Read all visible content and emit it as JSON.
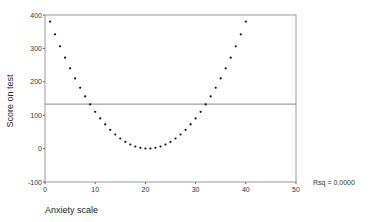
{
  "chart_data": {
    "type": "scatter",
    "title": "",
    "xlabel": "Anxiety scale",
    "ylabel": "Score on test",
    "xlim": [
      0,
      50
    ],
    "ylim": [
      -100,
      400
    ],
    "xticks": [
      0,
      10,
      20,
      30,
      40,
      50
    ],
    "yticks": [
      -100,
      0,
      100,
      200,
      300,
      400
    ],
    "grid": false,
    "legend": null,
    "series": [
      {
        "name": "observations",
        "marker": "dot",
        "color": "#111111",
        "x": [
          1,
          2,
          3,
          4,
          5,
          6,
          7,
          8,
          9,
          10,
          11,
          12,
          13,
          14,
          15,
          16,
          17,
          18,
          19,
          20,
          21,
          22,
          23,
          24,
          25,
          26,
          27,
          28,
          29,
          30,
          31,
          32,
          33,
          34,
          35,
          36,
          37,
          38,
          39,
          40
        ],
        "y": [
          380.25,
          342.25,
          306.25,
          272.25,
          240.25,
          210.25,
          182.25,
          156.25,
          132.25,
          110.25,
          90.25,
          72.25,
          56.25,
          42.25,
          30.25,
          20.25,
          12.25,
          6.25,
          2.25,
          0.25,
          0.25,
          2.25,
          6.25,
          12.25,
          20.25,
          30.25,
          42.25,
          56.25,
          72.25,
          90.25,
          110.25,
          132.25,
          156.25,
          182.25,
          210.25,
          240.25,
          272.25,
          306.25,
          342.25,
          380.25
        ]
      }
    ],
    "fit_line": {
      "type": "linear",
      "intercept": 133.25,
      "slope": 0,
      "color": "#888888"
    },
    "annotations": [
      {
        "text": "Rsq = 0.0000",
        "position": "right of x-axis"
      }
    ]
  },
  "labels": {
    "xlabel": "Anxiety scale",
    "ylabel": "Score on test",
    "rsq": "Rsq = 0.0000"
  }
}
